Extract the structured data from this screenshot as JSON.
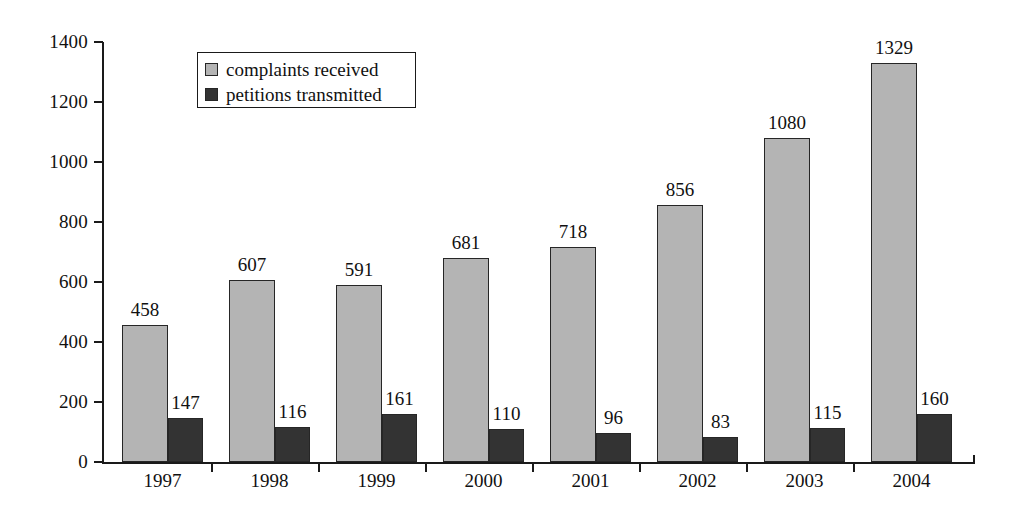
{
  "chart_data": {
    "type": "bar",
    "title": "",
    "subtitle": "",
    "xlabel": "",
    "ylabel": "",
    "ylim": [
      0,
      1400
    ],
    "yticks": [
      0,
      200,
      400,
      600,
      800,
      1000,
      1200,
      1400
    ],
    "ytick_labels": [
      "0",
      "200",
      "400",
      "600",
      "800",
      "1000",
      "1200",
      "1400"
    ],
    "grid": false,
    "legend_position": "upper-left-inside",
    "categories": [
      "1997",
      "1998",
      "1999",
      "2000",
      "2001",
      "2002",
      "2003",
      "2004"
    ],
    "series": [
      {
        "name": "complaints received",
        "color": "#b4b4b4",
        "values": [
          458,
          607,
          591,
          681,
          718,
          856,
          1080,
          1329
        ],
        "value_labels": [
          "458",
          "607",
          "591",
          "681",
          "718",
          "856",
          "1080",
          "1329"
        ]
      },
      {
        "name": "petitions transmitted",
        "color": "#333333",
        "values": [
          147,
          116,
          161,
          110,
          96,
          83,
          115,
          160
        ],
        "value_labels": [
          "147",
          "116",
          "161",
          "110",
          "96",
          "83",
          "115",
          "160"
        ]
      }
    ],
    "annotations": []
  },
  "legend": {
    "items": [
      {
        "label": "complaints received",
        "swatch": "light-gray-square-icon"
      },
      {
        "label": "petitions transmitted",
        "swatch": "dark-gray-square-icon"
      }
    ]
  },
  "colors": {
    "series_light": "#b4b4b4",
    "series_dark": "#333333",
    "axis": "#1a1a1a",
    "text": "#111111",
    "background": "#ffffff"
  }
}
